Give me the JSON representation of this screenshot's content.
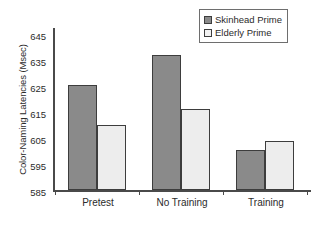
{
  "chart_data": {
    "type": "bar",
    "title": "",
    "xlabel": "",
    "ylabel": "Color-Naming Latencies (Msec)",
    "categories": [
      "Pretest",
      "No Training",
      "Training"
    ],
    "series": [
      {
        "name": "Skinhead Prime",
        "values": [
          624,
          635,
          600
        ],
        "color": "#8a8a8a"
      },
      {
        "name": "Elderly Prime",
        "values": [
          609,
          615,
          603
        ],
        "color": "#ededed"
      }
    ],
    "ylim": [
      585,
      645
    ],
    "ytick_step": 10,
    "yticks": [
      "645",
      "635",
      "625",
      "615",
      "605",
      "595",
      "585"
    ],
    "grid": false,
    "legend_position": "top-right"
  },
  "legend": {
    "items": [
      {
        "label": "Skinhead Prime",
        "swatch": "dark"
      },
      {
        "label": "Elderly Prime",
        "swatch": "light"
      }
    ]
  },
  "colors": {
    "series_dark": "#8a8a8a",
    "series_light": "#ededed",
    "axis": "#4a4a4a",
    "outline": "#3d3d3d",
    "text": "#2b2b2b",
    "background": "#ffffff"
  }
}
